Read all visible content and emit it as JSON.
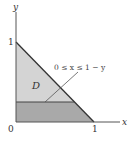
{
  "diagram": {
    "axes": {
      "x_label": "x",
      "y_label": "y",
      "origin_label": "0",
      "x_tick_label": "1",
      "y_tick_label": "1"
    },
    "region": {
      "label": "D",
      "description": "Triangle bounded by x=0, y=0, x+y=1",
      "fill_color": "#d4d4d4",
      "strip_fill_color": "#a9a9a9"
    },
    "annotation": {
      "text": "0 ≤ x ≤ 1 − y"
    },
    "colors": {
      "axis": "#555555",
      "edge": "#333333",
      "background": "#ffffff"
    }
  }
}
